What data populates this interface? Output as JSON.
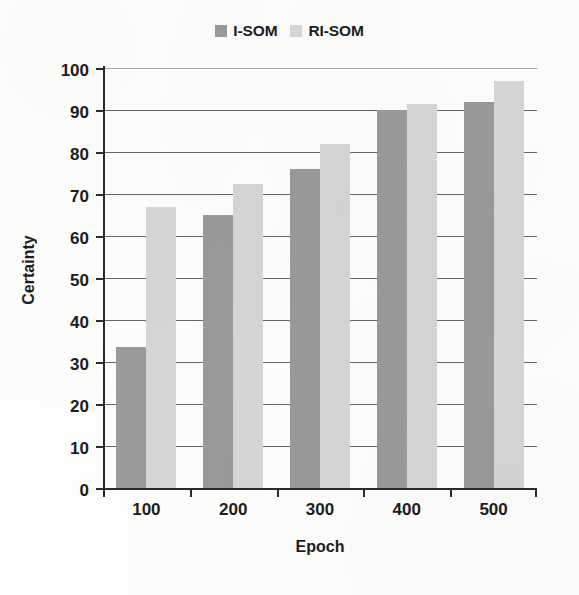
{
  "chart_data": {
    "type": "bar",
    "title": "",
    "xlabel": "Epoch",
    "ylabel": "Certainty",
    "categories": [
      "100",
      "200",
      "300",
      "400",
      "500"
    ],
    "series": [
      {
        "name": "I-SOM",
        "color": "#9a9a9a",
        "values": [
          33.5,
          65,
          76,
          90,
          92
        ]
      },
      {
        "name": "RI-SOM",
        "color": "#d7d7d7",
        "values": [
          67,
          72.5,
          82,
          91.5,
          97
        ]
      }
    ],
    "ylim": [
      0,
      100
    ],
    "ytick_step": 10,
    "yticks": [
      100,
      90,
      80,
      70,
      60,
      50,
      40,
      30,
      20,
      10,
      0
    ],
    "grid": true,
    "legend_position": "top-center"
  },
  "legend": {
    "items": [
      {
        "label": "I-SOM",
        "swatch_color": "#9a9a9a"
      },
      {
        "label": "RI-SOM",
        "swatch_color": "#d7d7d7"
      }
    ]
  },
  "axes": {
    "y_title": "Certainty",
    "x_title": "Epoch"
  }
}
